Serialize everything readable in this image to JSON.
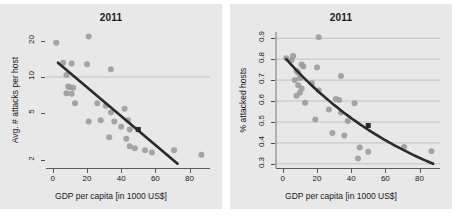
{
  "figure": {
    "background": "#ffffff",
    "panel_background": "#e8e8e8",
    "point_color": "#9d9d9d",
    "line_color": "#2b2b2b",
    "grid_color": "#b9b9b9"
  },
  "panels": [
    {
      "key": "left",
      "title": "2011",
      "xlabel": "GDP per capita [in 1000 US$]",
      "ylabel": "Avg. # attacks per host",
      "xticks": [
        "0",
        "20",
        "40",
        "60",
        "80"
      ],
      "yticks": [
        "2",
        "5",
        "10",
        "20"
      ]
    },
    {
      "key": "right",
      "title": "2011",
      "xlabel": "GDP per capita [in 1000 US$]",
      "ylabel": "% attacked hosts",
      "xticks": [
        "0",
        "20",
        "40",
        "60",
        "80"
      ],
      "yticks": [
        "0.3",
        "0.4",
        "0.5",
        "0.6",
        "0.7",
        "0.8",
        "0.9"
      ]
    }
  ],
  "chart_data": [
    {
      "type": "scatter",
      "panel": "left",
      "title": "2011",
      "xlabel": "GDP per capita [in 1000 US$]",
      "ylabel": "Avg. # attacks per host",
      "xlim": [
        -4,
        92
      ],
      "ylim": [
        1.7,
        24
      ],
      "yscale": "log",
      "xscale": "linear",
      "xticks": [
        0,
        20,
        40,
        60,
        80
      ],
      "yticks": [
        2,
        5,
        10,
        20
      ],
      "grid": "horizontal-at-y10",
      "legend": "none",
      "points": [
        {
          "x": 2,
          "y": 19.5
        },
        {
          "x": 21,
          "y": 22.0
        },
        {
          "x": 6,
          "y": 13.2
        },
        {
          "x": 11,
          "y": 13.0
        },
        {
          "x": 20,
          "y": 12.8
        },
        {
          "x": 34,
          "y": 11.6
        },
        {
          "x": 8,
          "y": 10.4
        },
        {
          "x": 9,
          "y": 8.3
        },
        {
          "x": 10,
          "y": 8.2
        },
        {
          "x": 12,
          "y": 8.1
        },
        {
          "x": 8,
          "y": 7.3
        },
        {
          "x": 11,
          "y": 7.2
        },
        {
          "x": 13,
          "y": 6.0
        },
        {
          "x": 26,
          "y": 6.0
        },
        {
          "x": 31,
          "y": 5.7
        },
        {
          "x": 42,
          "y": 5.4
        },
        {
          "x": 34,
          "y": 5.0
        },
        {
          "x": 21,
          "y": 4.2
        },
        {
          "x": 28,
          "y": 4.3
        },
        {
          "x": 36,
          "y": 4.2
        },
        {
          "x": 44,
          "y": 4.3
        },
        {
          "x": 40,
          "y": 3.8
        },
        {
          "x": 45,
          "y": 3.6
        },
        {
          "x": 33,
          "y": 3.1
        },
        {
          "x": 43,
          "y": 3.0
        },
        {
          "x": 45,
          "y": 2.6
        },
        {
          "x": 48,
          "y": 2.5
        },
        {
          "x": 54,
          "y": 2.4
        },
        {
          "x": 58,
          "y": 2.3
        },
        {
          "x": 71,
          "y": 2.4
        },
        {
          "x": 87,
          "y": 2.2
        }
      ],
      "fit_line": {
        "x0": 3,
        "y0": 13.2,
        "x1": 73,
        "y1": 1.85,
        "style": "log-linear"
      },
      "highlight_marker": {
        "x": 50,
        "y": 3.6,
        "shape": "square",
        "color": "#2b2b2b"
      }
    },
    {
      "type": "scatter",
      "panel": "right",
      "title": "2011",
      "xlabel": "GDP per capita [in 1000 US$]",
      "ylabel": "% attacked hosts",
      "xlim": [
        -4,
        92
      ],
      "ylim": [
        0.28,
        0.93
      ],
      "yscale": "linear",
      "xscale": "linear",
      "xticks": [
        0,
        20,
        40,
        60,
        80
      ],
      "yticks": [
        0.3,
        0.4,
        0.5,
        0.6,
        0.7,
        0.8,
        0.9
      ],
      "grid": "horizontal",
      "legend": "none",
      "points": [
        {
          "x": 21,
          "y": 0.905
        },
        {
          "x": 2,
          "y": 0.805
        },
        {
          "x": 6,
          "y": 0.815
        },
        {
          "x": 5,
          "y": 0.795
        },
        {
          "x": 11,
          "y": 0.775
        },
        {
          "x": 12,
          "y": 0.765
        },
        {
          "x": 20,
          "y": 0.76
        },
        {
          "x": 8,
          "y": 0.745
        },
        {
          "x": 9,
          "y": 0.735
        },
        {
          "x": 34,
          "y": 0.72
        },
        {
          "x": 10,
          "y": 0.71
        },
        {
          "x": 7,
          "y": 0.7
        },
        {
          "x": 17,
          "y": 0.685
        },
        {
          "x": 9,
          "y": 0.675
        },
        {
          "x": 11,
          "y": 0.66
        },
        {
          "x": 21,
          "y": 0.65
        },
        {
          "x": 10,
          "y": 0.64
        },
        {
          "x": 8,
          "y": 0.625
        },
        {
          "x": 31,
          "y": 0.61
        },
        {
          "x": 33,
          "y": 0.605
        },
        {
          "x": 13,
          "y": 0.592
        },
        {
          "x": 42,
          "y": 0.59
        },
        {
          "x": 27,
          "y": 0.56
        },
        {
          "x": 34,
          "y": 0.545
        },
        {
          "x": 19,
          "y": 0.512
        },
        {
          "x": 38,
          "y": 0.505
        },
        {
          "x": 29,
          "y": 0.447
        },
        {
          "x": 36,
          "y": 0.435
        },
        {
          "x": 45,
          "y": 0.378
        },
        {
          "x": 71,
          "y": 0.38
        },
        {
          "x": 50,
          "y": 0.358
        },
        {
          "x": 87,
          "y": 0.36
        },
        {
          "x": 44,
          "y": 0.325
        }
      ],
      "fit_line": {
        "x0": 2,
        "y0": 0.8,
        "x1": 88,
        "y1": 0.3,
        "style": "exponential-decay"
      },
      "highlight_marker": {
        "x": 50,
        "y": 0.483,
        "shape": "square",
        "color": "#2b2b2b"
      }
    }
  ]
}
